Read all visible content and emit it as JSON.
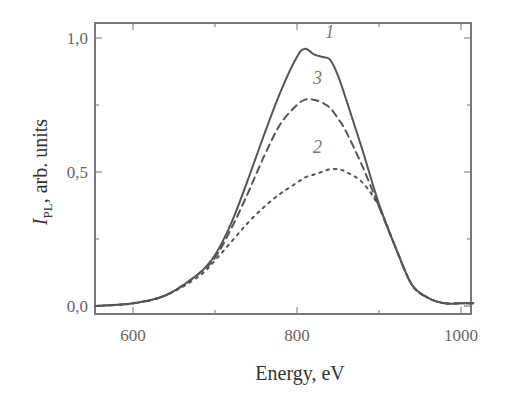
{
  "chart_data": {
    "type": "line",
    "title": "",
    "xlabel": "Energy, eV",
    "ylabel": "I_PL, arb. units",
    "ylabel_main": "I",
    "ylabel_sub": "PL",
    "ylabel_rest": ", arb. units",
    "xlim": [
      555,
      1015
    ],
    "ylim": [
      -0.03,
      1.06
    ],
    "x_ticks": [
      600,
      800,
      1000
    ],
    "x_tick_labels": [
      "600",
      "800",
      "1000"
    ],
    "y_ticks": [
      0.0,
      0.5,
      1.0
    ],
    "y_tick_labels": [
      "0,0",
      "0,5",
      "1,0"
    ],
    "grid": false,
    "legend": "inline curve labels",
    "x": [
      555,
      600,
      640,
      680,
      700,
      720,
      740,
      760,
      780,
      800,
      810,
      820,
      830,
      840,
      850,
      860,
      880,
      900,
      920,
      940,
      960,
      980,
      1000,
      1015
    ],
    "series": [
      {
        "name": "1",
        "style": "solid",
        "values": [
          0.0,
          0.01,
          0.04,
          0.12,
          0.19,
          0.31,
          0.47,
          0.64,
          0.8,
          0.93,
          0.96,
          0.94,
          0.93,
          0.92,
          0.86,
          0.77,
          0.58,
          0.38,
          0.22,
          0.08,
          0.03,
          0.01,
          0.01,
          0.01
        ]
      },
      {
        "name": "2",
        "style": "dotted",
        "values": [
          0.0,
          0.01,
          0.04,
          0.11,
          0.17,
          0.24,
          0.31,
          0.37,
          0.42,
          0.46,
          0.48,
          0.49,
          0.5,
          0.51,
          0.51,
          0.5,
          0.46,
          0.37,
          0.22,
          0.08,
          0.03,
          0.01,
          0.01,
          0.01
        ]
      },
      {
        "name": "3",
        "style": "dashed",
        "values": [
          0.0,
          0.01,
          0.04,
          0.12,
          0.18,
          0.29,
          0.42,
          0.56,
          0.68,
          0.75,
          0.77,
          0.77,
          0.76,
          0.74,
          0.7,
          0.65,
          0.52,
          0.37,
          0.22,
          0.08,
          0.03,
          0.01,
          0.01,
          0.01
        ]
      }
    ],
    "annotations": [
      {
        "text": "1",
        "x": 840,
        "y": 1.0
      },
      {
        "text": "3",
        "x": 825,
        "y": 0.83
      },
      {
        "text": "2",
        "x": 825,
        "y": 0.57
      }
    ]
  }
}
